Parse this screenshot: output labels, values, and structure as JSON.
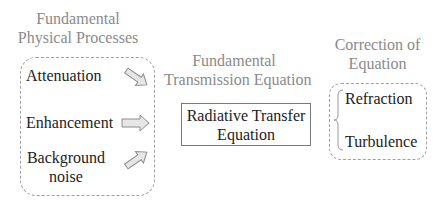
{
  "sections": {
    "left": {
      "title_line1": "Fundamental",
      "title_line2": "Physical Processes",
      "items": [
        {
          "label": "Attenuation"
        },
        {
          "label": "Enhancement"
        },
        {
          "label_line1": "Background",
          "label_line2": "noise"
        }
      ]
    },
    "middle": {
      "title_line1": "Fundamental",
      "title_line2": "Transmission Equation",
      "box_line1": "Radiative Transfer",
      "box_line2": "Equation"
    },
    "right": {
      "title_line1": "Correction of",
      "title_line2": "Equation",
      "items": [
        {
          "label": "Refraction"
        },
        {
          "label": "Turbulence"
        }
      ]
    }
  },
  "icons": {
    "arrow_1": "arrow-down-right-icon",
    "arrow_2": "arrow-right-icon",
    "arrow_3": "arrow-up-right-icon",
    "brace": "left-brace-icon"
  },
  "colors": {
    "title_text": "#8a8a8a",
    "body_text": "#222222",
    "border": "#a0a0a0",
    "arrow_fill": "#e6e6e6",
    "arrow_stroke": "#8c8c8c"
  }
}
